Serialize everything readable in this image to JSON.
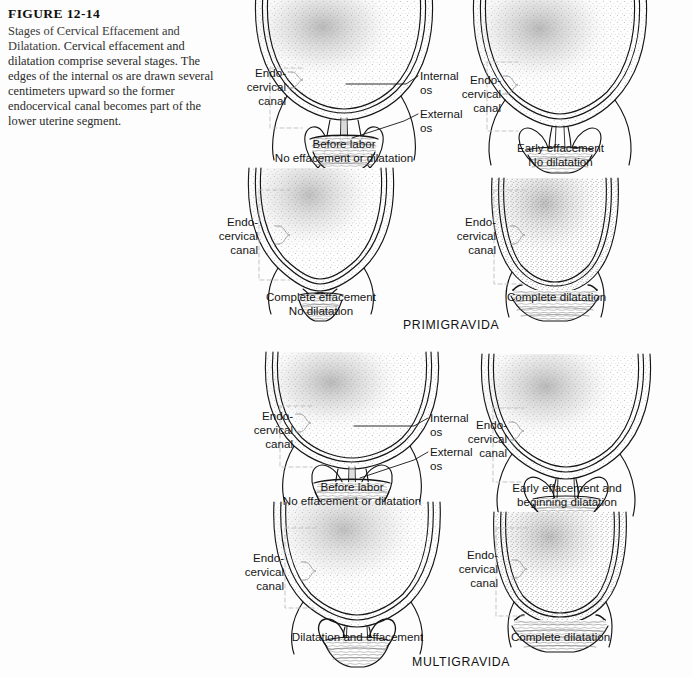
{
  "figure": {
    "number": "FIGURE 12-14",
    "title": "Stages of Cervical Effacement and Dilatation.",
    "caption_body": " Cervical effacement and dilatation comprise several stages. The edges of the internal os are drawn several centimeters upward so the former endocervical canal becomes part of the lower uterine segment.",
    "running_head": ""
  },
  "sections": [
    {
      "id": "primigravida",
      "label": "PRIMIGRAVIDA"
    },
    {
      "id": "multigravida",
      "label": "MULTIGRAVIDA"
    }
  ],
  "labels": {
    "endocervical_canal": "Endo-\ncervical\ncanal",
    "endocervical_canal_line1": "Endo-",
    "endocervical_canal_line2": "cervical",
    "endocervical_canal_line3": "canal",
    "internal_os_line1": "Internal",
    "internal_os_line2": "os",
    "external_os_line1": "External",
    "external_os_line2": "os"
  },
  "panels": [
    {
      "id": "primi-before-labor",
      "section": "primigravida",
      "caption_line1": "Before  labor",
      "caption_line2": "No effacement or dilatation",
      "stage": "before-labor",
      "has_os_labels": true
    },
    {
      "id": "primi-early-effacement",
      "section": "primigravida",
      "caption_line1": "Early effacement",
      "caption_line2": "No dilatation",
      "stage": "early-effacement",
      "has_os_labels": false
    },
    {
      "id": "primi-complete-effacement",
      "section": "primigravida",
      "caption_line1": "Complete effacement",
      "caption_line2": "No dilatation",
      "stage": "complete-effacement",
      "has_os_labels": false
    },
    {
      "id": "primi-complete-dilatation",
      "section": "primigravida",
      "caption_line1": "Complete dilatation",
      "caption_line2": "",
      "stage": "complete-dilatation",
      "has_os_labels": false
    },
    {
      "id": "multi-before-labor",
      "section": "multigravida",
      "caption_line1": "Before labor",
      "caption_line2": "No effacement or dilatation",
      "stage": "before-labor",
      "has_os_labels": true
    },
    {
      "id": "multi-early-effacement",
      "section": "multigravida",
      "caption_line1": "Early effacement and",
      "caption_line2": "beginning dilatation",
      "stage": "early-effacement",
      "has_os_labels": false
    },
    {
      "id": "multi-dilatation-effacement",
      "section": "multigravida",
      "caption_line1": "Dilatation and effacement",
      "caption_line2": "",
      "stage": "dilatation-effacement",
      "has_os_labels": false
    },
    {
      "id": "multi-complete-dilatation",
      "section": "multigravida",
      "caption_line1": "Complete dilatation",
      "caption_line2": "",
      "stage": "complete-dilatation",
      "has_os_labels": false
    }
  ],
  "colors": {
    "ink": "#151515",
    "stipple": "#8d8d8d",
    "leader": "#9a9a9a",
    "page": "#fdfdfd"
  }
}
